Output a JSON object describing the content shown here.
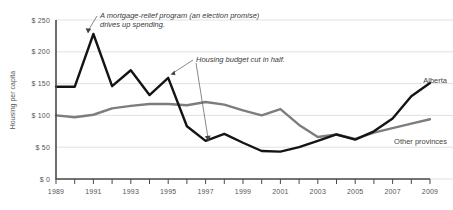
{
  "chart_data": {
    "type": "line",
    "title": "",
    "xlabel": "",
    "ylabel": "Housing per capita",
    "xlim": [
      1989,
      2009
    ],
    "ylim": [
      0,
      250
    ],
    "grid": true,
    "legend_position": "inline-end-labels",
    "x": [
      1989,
      1990,
      1991,
      1992,
      1993,
      1994,
      1995,
      1996,
      1997,
      1998,
      1999,
      2000,
      2001,
      2002,
      2003,
      2004,
      2005,
      2006,
      2007,
      2008,
      2009
    ],
    "y_ticks": [
      0,
      50,
      100,
      150,
      200,
      250
    ],
    "y_tick_labels": [
      "$ 0",
      "$ 50",
      "$ 100",
      "$ 150",
      "$ 200",
      "$ 250"
    ],
    "x_ticks": [
      1989,
      1990,
      1991,
      1992,
      1993,
      1994,
      1995,
      1996,
      1997,
      1998,
      1999,
      2000,
      2001,
      2002,
      2003,
      2004,
      2005,
      2006,
      2007,
      2008,
      2009
    ],
    "x_tick_labels": [
      "1989",
      "",
      "1991",
      "",
      "1993",
      "",
      "1995",
      "",
      "1997",
      "",
      "1999",
      "",
      "2001",
      "",
      "2003",
      "",
      "2005",
      "",
      "2007",
      "",
      "2009"
    ],
    "x_tick_labels_shown": [
      "1989",
      "1991",
      "1993",
      "1995",
      "1997",
      "1999",
      "2001",
      "2003",
      "2005",
      "2007",
      "2009"
    ],
    "series": [
      {
        "name": "Alberta",
        "color": "#141414",
        "label": "Alberta",
        "values": [
          145,
          145,
          228,
          146,
          171,
          132,
          159,
          83,
          60,
          71,
          57,
          44,
          43,
          50,
          60,
          70,
          62,
          75,
          95,
          130,
          151
        ]
      },
      {
        "name": "Other provinces",
        "color": "#7d7d7d",
        "label": "Other provinces",
        "values": [
          100,
          97,
          101,
          111,
          115,
          118,
          118,
          116,
          121,
          117,
          108,
          100,
          110,
          85,
          66,
          70,
          63,
          73,
          80,
          87,
          94
        ]
      }
    ],
    "annotations": [
      {
        "id": "mortgage-relief",
        "text_line_1": "A mortgage-relief program (an election promise)",
        "text_line_2": "drives up spending.",
        "points_to_year": 1991,
        "points_to_value": 228
      },
      {
        "id": "budget-cut",
        "text_line_1": "Housing budget cut in half.",
        "text_line_2": "",
        "points_to_year": 1995,
        "points_to_value": 159
      }
    ]
  }
}
